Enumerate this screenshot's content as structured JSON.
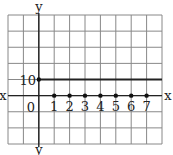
{
  "chart_data": {
    "type": "scatter",
    "title": "",
    "xlabel": "x",
    "ylabel": "y",
    "origin_label": "0",
    "x_tick_labels": [
      "1",
      "2",
      "3",
      "4",
      "5",
      "6",
      "7"
    ],
    "y_tick_labels": [
      "10"
    ],
    "grid": true,
    "series": [
      {
        "name": "points",
        "x": [
          1,
          2,
          3,
          4,
          5,
          6,
          7
        ],
        "y": [
          0,
          0,
          0,
          0,
          0,
          0,
          0
        ]
      },
      {
        "name": "horizontal line y=10",
        "type": "line",
        "x": [
          0,
          8
        ],
        "y": [
          10,
          10
        ],
        "start_point": [
          0,
          10
        ]
      }
    ],
    "colors": {
      "grid": "#888888",
      "axis": "#222222",
      "line": "#222222",
      "points": "#111111"
    }
  }
}
